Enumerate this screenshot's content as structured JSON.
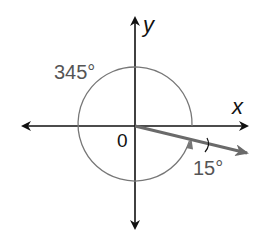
{
  "diagram": {
    "type": "angle-in-standard-position",
    "colors": {
      "axes": "#111111",
      "circle": "#777777",
      "terminal_ray": "#6a6a6a",
      "label_gray": "#555555",
      "label_black": "#111111"
    },
    "axes": {
      "x_label": "x",
      "y_label": "y",
      "origin_label": "0"
    },
    "angles": {
      "rotation_label": "345°",
      "reference_label": "15°",
      "rotation_degrees": 345,
      "reference_degrees": 15
    }
  }
}
